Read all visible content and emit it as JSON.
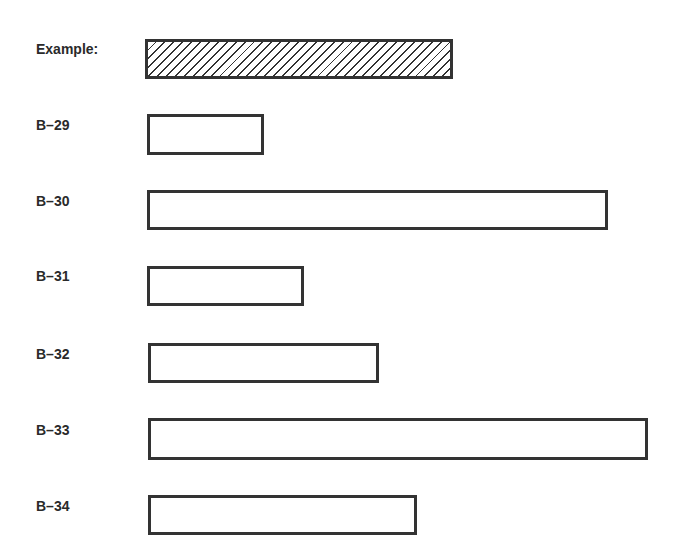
{
  "legend": {
    "label": "Example:",
    "pattern": "diagonal-hatch"
  },
  "rows": [
    {
      "label": "B–29",
      "length_px": 116
    },
    {
      "label": "B–30",
      "length_px": 460
    },
    {
      "label": "B–31",
      "length_px": 156
    },
    {
      "label": "B–32",
      "length_px": 230
    },
    {
      "label": "B–33",
      "length_px": 499
    },
    {
      "label": "B–34",
      "length_px": 268
    }
  ],
  "example_length_px": 307,
  "colors": {
    "stroke": "#333333",
    "fill": "#ffffff"
  }
}
